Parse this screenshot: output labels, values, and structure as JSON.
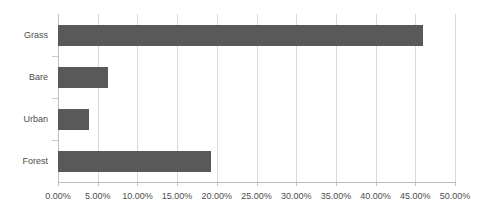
{
  "chart_data": {
    "type": "bar",
    "orientation": "horizontal",
    "title": "",
    "subtitle": "",
    "xlabel": "",
    "ylabel": "",
    "categories": [
      "Grass",
      "Bare",
      "Urban",
      "Forest"
    ],
    "values": [
      46.0,
      6.3,
      3.9,
      19.3
    ],
    "series": [
      {
        "name": "",
        "values": [
          46.0,
          6.3,
          3.9,
          19.3
        ]
      }
    ],
    "xlim": [
      0,
      50
    ],
    "xtick_values": [
      0,
      5,
      10,
      15,
      20,
      25,
      30,
      35,
      40,
      45,
      50
    ],
    "xtick_labels": [
      "0.00%",
      "5.00%",
      "10.00%",
      "15.00%",
      "20.00%",
      "25.00%",
      "30.00%",
      "35.00%",
      "40.00%",
      "45.00%",
      "50.00%"
    ],
    "grid": "vertical",
    "legend": "none",
    "colors": {
      "bar": "#595959",
      "gridline": "#d9d9d9",
      "axis": "#bfbfbf",
      "text": "#4d4d4d",
      "background": "#ffffff"
    }
  }
}
